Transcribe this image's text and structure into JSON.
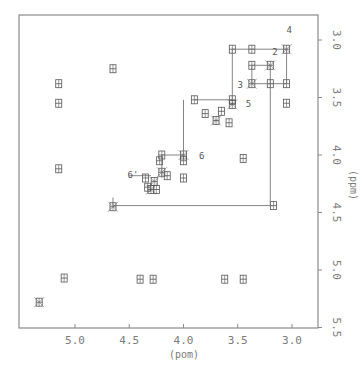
{
  "chart_data": {
    "type": "heatmap",
    "subtype": "2D NMR contour plot (COSY-like)",
    "title": "",
    "xlabel": "(ppm)",
    "ylabel": "(ppm)",
    "xlim": [
      5.5,
      2.8
    ],
    "ylim": [
      2.8,
      5.5
    ],
    "x_ticks": [
      "5.0",
      "4.5",
      "4.0",
      "3.5",
      "3.0"
    ],
    "x_tick_values": [
      5.0,
      4.5,
      4.0,
      3.5,
      3.0
    ],
    "y_ticks": [
      "3.0",
      "3.5",
      "4.0",
      "4.5",
      "5.0",
      "5.5"
    ],
    "y_tick_values": [
      3.0,
      3.5,
      4.0,
      4.5,
      5.0,
      5.5
    ],
    "grid": false,
    "legend": null,
    "peak_labels": [
      {
        "text": "4",
        "x": 3.05,
        "y": 3.02
      },
      {
        "text": "2",
        "x": 3.2,
        "y": 3.2
      },
      {
        "text": "3",
        "x": 3.42,
        "y": 3.4
      },
      {
        "text": "5",
        "x": 3.5,
        "y": 3.55
      },
      {
        "text": "6",
        "x": 3.95,
        "y": 4.0
      },
      {
        "text": "6'",
        "x": 4.35,
        "y": 4.18
      }
    ],
    "diagonal_peaks": [
      {
        "x": 3.05,
        "y": 3.08
      },
      {
        "x": 3.2,
        "y": 3.22
      },
      {
        "x": 3.37,
        "y": 3.38
      },
      {
        "x": 3.55,
        "y": 3.56
      },
      {
        "x": 3.7,
        "y": 3.7
      },
      {
        "x": 4.0,
        "y": 4.0
      },
      {
        "x": 4.2,
        "y": 4.15
      },
      {
        "x": 4.27,
        "y": 4.23
      },
      {
        "x": 4.3,
        "y": 4.3
      },
      {
        "x": 5.33,
        "y": 5.28
      },
      {
        "x": 4.65,
        "y": 4.45
      }
    ],
    "cross_peaks": [
      {
        "x": 3.55,
        "y": 3.08
      },
      {
        "x": 3.37,
        "y": 3.08
      },
      {
        "x": 3.05,
        "y": 3.38
      },
      {
        "x": 3.05,
        "y": 3.55
      },
      {
        "x": 3.37,
        "y": 3.22
      },
      {
        "x": 3.2,
        "y": 3.38
      },
      {
        "x": 3.9,
        "y": 3.52
      },
      {
        "x": 3.55,
        "y": 3.52
      },
      {
        "x": 3.65,
        "y": 3.62
      },
      {
        "x": 3.8,
        "y": 3.64
      },
      {
        "x": 3.58,
        "y": 3.72
      },
      {
        "x": 4.2,
        "y": 4.0
      },
      {
        "x": 4.0,
        "y": 4.05
      },
      {
        "x": 4.22,
        "y": 4.05
      },
      {
        "x": 4.35,
        "y": 4.2
      },
      {
        "x": 4.15,
        "y": 4.18
      },
      {
        "x": 4.0,
        "y": 4.2
      },
      {
        "x": 4.33,
        "y": 4.28
      },
      {
        "x": 4.25,
        "y": 4.3
      },
      {
        "x": 3.17,
        "y": 4.44
      },
      {
        "x": 4.65,
        "y": 3.25
      },
      {
        "x": 5.1,
        "y": 5.07
      },
      {
        "x": 4.28,
        "y": 5.08
      },
      {
        "x": 3.62,
        "y": 5.08
      },
      {
        "x": 3.45,
        "y": 5.08
      },
      {
        "x": 4.4,
        "y": 5.08
      },
      {
        "x": 3.45,
        "y": 4.03
      },
      {
        "x": 5.15,
        "y": 4.12
      },
      {
        "x": 5.15,
        "y": 3.38
      },
      {
        "x": 5.15,
        "y": 3.55
      }
    ],
    "connectivity_lines": [
      {
        "from": [
          3.55,
          3.08
        ],
        "to": [
          3.05,
          3.08
        ]
      },
      {
        "from": [
          3.05,
          3.08
        ],
        "to": [
          3.05,
          3.38
        ]
      },
      {
        "from": [
          3.55,
          3.08
        ],
        "to": [
          3.55,
          3.52
        ]
      },
      {
        "from": [
          3.37,
          3.22
        ],
        "to": [
          3.2,
          3.22
        ]
      },
      {
        "from": [
          3.37,
          3.22
        ],
        "to": [
          3.37,
          3.38
        ]
      },
      {
        "from": [
          3.37,
          3.38
        ],
        "to": [
          3.05,
          3.38
        ]
      },
      {
        "from": [
          3.2,
          3.22
        ],
        "to": [
          3.2,
          4.44
        ]
      },
      {
        "from": [
          3.9,
          3.52
        ],
        "to": [
          3.55,
          3.52
        ]
      },
      {
        "from": [
          4.0,
          3.52
        ],
        "to": [
          4.0,
          4.0
        ]
      },
      {
        "from": [
          4.2,
          4.0
        ],
        "to": [
          4.0,
          4.0
        ]
      },
      {
        "from": [
          4.2,
          4.0
        ],
        "to": [
          4.2,
          4.2
        ]
      },
      {
        "from": [
          4.5,
          4.18
        ],
        "to": [
          4.3,
          4.18
        ]
      },
      {
        "from": [
          4.65,
          4.44
        ],
        "to": [
          3.17,
          4.44
        ]
      },
      {
        "from": [
          4.65,
          4.37
        ],
        "to": [
          4.65,
          4.44
        ]
      }
    ]
  },
  "axes": {
    "x_label": "(pom)",
    "y_label": "(ppm)",
    "x_ticks": [
      "5.0",
      "4.5",
      "4.0",
      "3.5",
      "3.0"
    ],
    "y_ticks": [
      "3.0",
      "3.5",
      "4.0",
      "4.5",
      "5.0",
      "5.5"
    ]
  },
  "colors": {
    "frame": "#8a8a8a",
    "peak": "#555555",
    "line": "#777777",
    "text": "#7a7a7a"
  }
}
